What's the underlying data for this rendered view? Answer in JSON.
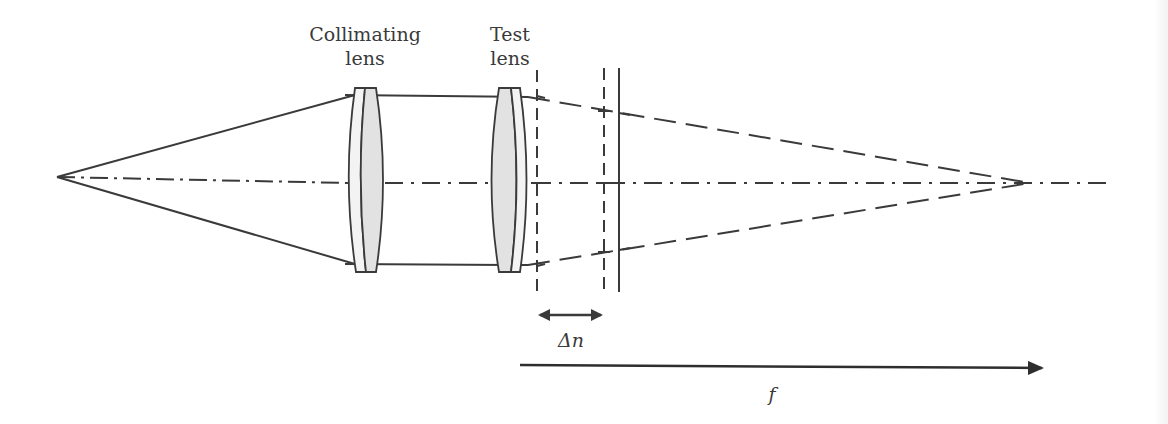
{
  "diagram": {
    "type": "optical-setup",
    "labels": {
      "collimating_lens_line1": "Collimating",
      "collimating_lens_line2": "lens",
      "test_lens_line1": "Test",
      "test_lens_line2": "lens",
      "delta_n": "Δn",
      "focal_length": "f"
    },
    "colors": {
      "stroke": "#3a3a3a",
      "lens_fill": "#e2e2e2",
      "lens_outer_fill": "#f3f3f3",
      "background": "#ffffff"
    },
    "elements": {
      "source_point": {
        "x": 57,
        "y": 177
      },
      "optical_axis_y": 183,
      "collimating_lens_x": 365,
      "test_lens_x": 507,
      "focus_point": {
        "x": 1030,
        "y": 183
      },
      "dashed_plane_1_x": 537,
      "dashed_plane_2_x": 604,
      "screen_plane_x": 619
    }
  }
}
